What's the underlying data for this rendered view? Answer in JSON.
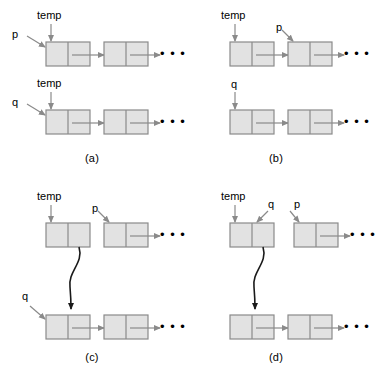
{
  "figure": {
    "node_fill": "#e2e2e2",
    "node_stroke": "#8a8a8a",
    "arrow_color": "#8a8a8a",
    "curve_color": "#1a1a1a",
    "text_color": "#000000",
    "background": "#ffffff"
  },
  "panels": [
    {
      "id": "a",
      "caption": "(a)",
      "rows": [
        {
          "id": "a-row-1",
          "pointers": [
            {
              "name": "temp",
              "label": "temp",
              "style": "vertical"
            },
            {
              "name": "p",
              "label": "p",
              "style": "diagonal"
            }
          ],
          "nodes": 2,
          "ellipsis": "• • •",
          "first_node_has_link": true
        },
        {
          "id": "a-row-2",
          "pointers": [
            {
              "name": "temp",
              "label": "temp",
              "style": "vertical"
            },
            {
              "name": "q",
              "label": "q",
              "style": "diagonal"
            }
          ],
          "nodes": 2,
          "ellipsis": "• • •",
          "first_node_has_link": true
        }
      ],
      "curve": false
    },
    {
      "id": "b",
      "caption": "(b)",
      "rows": [
        {
          "id": "b-row-1",
          "pointers": [
            {
              "name": "temp",
              "label": "temp",
              "style": "vertical"
            },
            {
              "name": "p",
              "label": "p",
              "style": "diagonal-second-node"
            }
          ],
          "nodes": 2,
          "ellipsis": "• • •",
          "first_node_has_link": true
        },
        {
          "id": "b-row-2",
          "pointers": [
            {
              "name": "q",
              "label": "q",
              "style": "vertical"
            }
          ],
          "nodes": 2,
          "ellipsis": "• • •",
          "first_node_has_link": true
        }
      ],
      "curve": false
    },
    {
      "id": "c",
      "caption": "(c)",
      "rows": [
        {
          "id": "c-row-1",
          "pointers": [
            {
              "name": "temp",
              "label": "temp",
              "style": "vertical"
            },
            {
              "name": "p",
              "label": "p",
              "style": "diagonal-second-node"
            }
          ],
          "nodes": 2,
          "ellipsis": "• • •",
          "first_node_has_link": false
        },
        {
          "id": "c-row-2",
          "pointers": [
            {
              "name": "q",
              "label": "q",
              "style": "diagonal"
            }
          ],
          "nodes": 2,
          "ellipsis": "• • •",
          "first_node_has_link": true
        }
      ],
      "curve": true
    },
    {
      "id": "d",
      "caption": "(d)",
      "rows": [
        {
          "id": "d-row-1",
          "pointers": [
            {
              "name": "temp",
              "label": "temp",
              "style": "vertical"
            },
            {
              "name": "q",
              "label": "q",
              "style": "diagonal-into-right-cell"
            },
            {
              "name": "p",
              "label": "p",
              "style": "diagonal-second-node"
            }
          ],
          "nodes": 2,
          "ellipsis": "• • •",
          "first_node_has_link": false
        },
        {
          "id": "d-row-2",
          "pointers": [],
          "nodes": 2,
          "ellipsis": "• • •",
          "first_node_has_link": true
        }
      ],
      "curve": true
    }
  ],
  "labels": {
    "temp": "temp",
    "p": "p",
    "q": "q",
    "ellipsis": "• • •",
    "caption_a": "(a)",
    "caption_b": "(b)",
    "caption_c": "(c)",
    "caption_d": "(d)"
  }
}
